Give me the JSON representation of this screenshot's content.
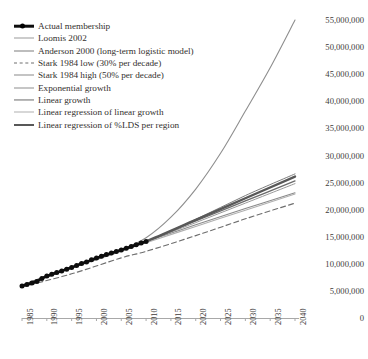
{
  "chart_data": {
    "type": "line",
    "title": "",
    "xlabel": "",
    "ylabel": "",
    "xlim": [
      1985,
      2040
    ],
    "ylim": [
      0,
      55000000
    ],
    "grid": false,
    "legend_position": "top-left",
    "x_ticks": [
      "1985",
      "1990",
      "1995",
      "2000",
      "2005",
      "2010",
      "2015",
      "2020",
      "2025",
      "2030",
      "2035",
      "2040"
    ],
    "y_ticks": [
      "0",
      "5,000,000",
      "10,000,000",
      "15,000,000",
      "20,000,000",
      "25,000,000",
      "30,000,000",
      "35,000,000",
      "40,000,000",
      "45,000,000",
      "50,000,000",
      "55,000,000"
    ],
    "series": [
      {
        "name": "Actual membership",
        "style": "line-with-round-markers",
        "color": "#0d0d0d",
        "width": 2.4,
        "x": [
          1985,
          1986,
          1987,
          1988,
          1989,
          1990,
          1991,
          1992,
          1993,
          1994,
          1995,
          1996,
          1997,
          1998,
          1999,
          2000,
          2001,
          2002,
          2003,
          2004,
          2005,
          2006,
          2007,
          2008,
          2009,
          2010
        ],
        "values": [
          5920000,
          6170000,
          6440000,
          6720000,
          7300000,
          7760000,
          8090000,
          8400000,
          8690000,
          9020000,
          9340000,
          9690000,
          10070000,
          10350000,
          10750000,
          11060000,
          11390000,
          11720000,
          11990000,
          12280000,
          12560000,
          12870000,
          13190000,
          13510000,
          13820000,
          14130000
        ]
      },
      {
        "name": "Loomis 2002",
        "style": "solid",
        "color": "#9a9a9a",
        "width": 1.0,
        "x": [
          1985,
          1995,
          2005,
          2010,
          2020,
          2030,
          2040
        ],
        "values": [
          5920000,
          9340000,
          12560000,
          14130000,
          17600000,
          21200000,
          24800000
        ]
      },
      {
        "name": "Anderson 2000 (long-term logistic model)",
        "style": "solid",
        "color": "#7d7d7d",
        "width": 1.0,
        "x": [
          1985,
          1995,
          2005,
          2010,
          2020,
          2030,
          2040
        ],
        "values": [
          5920000,
          9340000,
          12560000,
          14130000,
          18200000,
          22600000,
          26600000
        ]
      },
      {
        "name": "Stark 1984 low (30% per decade)",
        "style": "dashed",
        "color": "#6e6e6e",
        "width": 1.1,
        "x": [
          1985,
          1995,
          2005,
          2010,
          2020,
          2030,
          2040
        ],
        "values": [
          5750000,
          8150000,
          11100000,
          12300000,
          15200000,
          18300000,
          21200000
        ]
      },
      {
        "name": "Stark 1984 high (50% per decade)",
        "style": "solid",
        "color": "#8a8a8a",
        "width": 1.1,
        "x": [
          1985,
          1995,
          2005,
          2010,
          2020,
          2030,
          2040
        ],
        "values": [
          5920000,
          9340000,
          12560000,
          14130000,
          17200000,
          20200000,
          23100000
        ]
      },
      {
        "name": "Exponential growth",
        "style": "solid",
        "color": "#8e8e8e",
        "width": 1.1,
        "x": [
          1985,
          1995,
          2005,
          2010,
          2015,
          2020,
          2025,
          2030,
          2035,
          2040
        ],
        "values": [
          5920000,
          9340000,
          12560000,
          14800000,
          18600000,
          23800000,
          30400000,
          38200000,
          46200000,
          55000000
        ]
      },
      {
        "name": "Linear growth",
        "style": "solid",
        "color": "#6b6b6b",
        "width": 1.3,
        "x": [
          1985,
          1995,
          2005,
          2010,
          2020,
          2030,
          2040
        ],
        "values": [
          5920000,
          9340000,
          12560000,
          14130000,
          17900000,
          21600000,
          25300000
        ]
      },
      {
        "name": "Linear regression of linear growth",
        "style": "solid",
        "color": "#b0b0b0",
        "width": 1.1,
        "x": [
          1985,
          1995,
          2005,
          2010,
          2020,
          2030,
          2040
        ],
        "values": [
          6050000,
          9200000,
          12300000,
          13900000,
          16900000,
          19900000,
          22900000
        ]
      },
      {
        "name": "Linear regression of %LDS per region",
        "style": "solid",
        "color": "#585858",
        "width": 2.4,
        "x": [
          1985,
          1995,
          2005,
          2010,
          2020,
          2030,
          2040
        ],
        "values": [
          5920000,
          9340000,
          12560000,
          14130000,
          18100000,
          22100000,
          26100000
        ]
      }
    ]
  },
  "axis": {
    "line_color": "#a8a8a8"
  }
}
